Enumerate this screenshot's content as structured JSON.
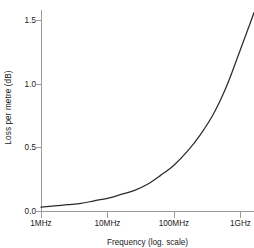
{
  "chart_data": {
    "type": "line",
    "title": "",
    "xlabel": "Frequency (log. scale)",
    "ylabel": "Loss per metre (dB)",
    "x_scale": "log",
    "x_tick_labels": [
      "1MHz",
      "10MHz",
      "100MHz",
      "1GHz"
    ],
    "x_tick_values": [
      1000000,
      10000000,
      100000000,
      1000000000
    ],
    "y_tick_labels": [
      "0.0",
      "0.5",
      "1.0",
      "1.5"
    ],
    "y_tick_values": [
      0.0,
      0.5,
      1.0,
      1.5
    ],
    "ylim": [
      0.0,
      1.58
    ],
    "xlim": [
      1000000,
      1600000000
    ],
    "grid": false,
    "legend": false,
    "series": [
      {
        "name": "Loss per metre",
        "color": "#2b2b2b",
        "x": [
          1000000,
          1600000,
          2500000,
          4000000,
          6300000,
          10000000,
          16000000,
          25000000,
          40000000,
          63000000,
          100000000,
          160000000,
          250000000,
          400000000,
          630000000,
          1000000000,
          1300000000,
          1600000000
        ],
        "y": [
          0.03,
          0.04,
          0.05,
          0.06,
          0.08,
          0.1,
          0.13,
          0.16,
          0.21,
          0.28,
          0.36,
          0.47,
          0.6,
          0.77,
          0.99,
          1.27,
          1.43,
          1.56
        ]
      }
    ]
  },
  "axes": {
    "y_title": "Loss per metre (dB)",
    "x_title": "Frequency (log. scale)"
  },
  "colors": {
    "curve": "#2b2b2b",
    "axis": "#9a9a9a",
    "text": "#1a1a1a",
    "background": "#ffffff"
  }
}
